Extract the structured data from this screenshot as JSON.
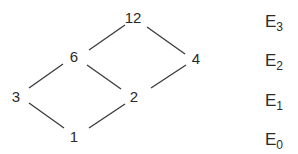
{
  "diagram": {
    "nodes": [
      {
        "id": "n12",
        "label": "12",
        "x": 133,
        "y": 17
      },
      {
        "id": "n6",
        "label": "6",
        "x": 74,
        "y": 56
      },
      {
        "id": "n4",
        "label": "4",
        "x": 196,
        "y": 58
      },
      {
        "id": "n3",
        "label": "3",
        "x": 16,
        "y": 96
      },
      {
        "id": "n2",
        "label": "2",
        "x": 134,
        "y": 96
      },
      {
        "id": "n1",
        "label": "1",
        "x": 74,
        "y": 136
      }
    ],
    "edges": [
      {
        "from": "3",
        "to": "6",
        "x1": 29,
        "y1": 88,
        "x2": 63,
        "y2": 64
      },
      {
        "from": "6",
        "to": "12",
        "x1": 89,
        "y1": 50,
        "x2": 125,
        "y2": 25
      },
      {
        "from": "12",
        "to": "4",
        "x1": 147,
        "y1": 27,
        "x2": 185,
        "y2": 54
      },
      {
        "from": "4",
        "to": "2",
        "x1": 186,
        "y1": 65,
        "x2": 151,
        "y2": 88
      },
      {
        "from": "6",
        "to": "2",
        "x1": 87,
        "y1": 65,
        "x2": 121,
        "y2": 89
      },
      {
        "from": "3",
        "to": "1",
        "x1": 29,
        "y1": 103,
        "x2": 64,
        "y2": 128
      },
      {
        "from": "1",
        "to": "2",
        "x1": 89,
        "y1": 128,
        "x2": 125,
        "y2": 104
      }
    ],
    "levels": [
      {
        "id": "E3",
        "base": "E",
        "sub": "3",
        "x": 265,
        "y": 27
      },
      {
        "id": "E2",
        "base": "E",
        "sub": "2",
        "x": 265,
        "y": 66
      },
      {
        "id": "E1",
        "base": "E",
        "sub": "1",
        "x": 265,
        "y": 106
      },
      {
        "id": "E0",
        "base": "E",
        "sub": "0",
        "x": 265,
        "y": 145
      }
    ]
  }
}
